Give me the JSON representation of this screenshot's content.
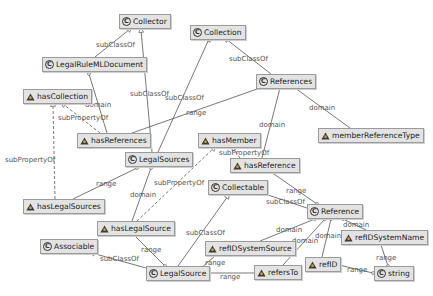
{
  "diagram": {
    "nodes": {
      "collector": {
        "label": "Collector",
        "kind": "class",
        "icon": "class-icon"
      },
      "collection": {
        "label": "Collection",
        "kind": "class",
        "icon": "class-icon"
      },
      "legalruleml_document": {
        "label": "LegalRuleMLDocument",
        "kind": "class",
        "icon": "class-icon"
      },
      "references": {
        "label": "References",
        "kind": "class",
        "icon": "class-icon"
      },
      "has_collection": {
        "label": "hasCollection",
        "kind": "property",
        "icon": "object-property-icon"
      },
      "has_references": {
        "label": "hasReferences",
        "kind": "property",
        "icon": "object-property-icon"
      },
      "member_reference_type": {
        "label": "memberReferenceType",
        "kind": "property",
        "icon": "object-property-icon"
      },
      "has_member": {
        "label": "hasMember",
        "kind": "property",
        "icon": "object-property-icon"
      },
      "legal_sources": {
        "label": "LegalSources",
        "kind": "class",
        "icon": "class-icon"
      },
      "has_reference": {
        "label": "hasReference",
        "kind": "property",
        "icon": "object-property-icon"
      },
      "collectable": {
        "label": "Collectable",
        "kind": "class",
        "icon": "class-icon"
      },
      "has_legal_sources": {
        "label": "hasLegalSources",
        "kind": "property",
        "icon": "object-property-icon"
      },
      "reference": {
        "label": "Reference",
        "kind": "class",
        "icon": "class-icon"
      },
      "has_legal_source": {
        "label": "hasLegalSource",
        "kind": "property",
        "icon": "object-property-icon"
      },
      "ref_id_system_name": {
        "label": "refIDSystemName",
        "kind": "property",
        "icon": "object-property-icon"
      },
      "ref_id_system_source": {
        "label": "refIDSystemSource",
        "kind": "property",
        "icon": "object-property-icon"
      },
      "associable": {
        "label": "Associable",
        "kind": "class",
        "icon": "class-icon"
      },
      "ref_id": {
        "label": "refID",
        "kind": "property",
        "icon": "object-property-icon"
      },
      "legal_source": {
        "label": "LegalSource",
        "kind": "class",
        "icon": "class-icon"
      },
      "refers_to": {
        "label": "refersTo",
        "kind": "property",
        "icon": "object-property-icon"
      },
      "string": {
        "label": "string",
        "kind": "class",
        "icon": "class-icon"
      }
    },
    "class_glyph": "C",
    "edge_labels": {
      "e1": "subClassOf",
      "e2": "subClassOf",
      "e3": "subClassOf",
      "e4": "subClassOf",
      "e5": "domain",
      "e6": "subPropertyOf",
      "e7": "range",
      "e8": "domain",
      "e9": "domain",
      "e10": "subPropertyOf",
      "e11": "range",
      "e12": "subPropertyOf",
      "e13": "domain",
      "e14": "subPropertyOf",
      "e15": "range",
      "e16": "subClassOf",
      "e17": "range",
      "e18": "subClassOf",
      "e19": "domain",
      "e20": "domain",
      "e21": "domain",
      "e22": "domain",
      "e23": "range",
      "e24": "range",
      "e25": "range",
      "e26": "subClassOf",
      "e27": "range",
      "e28": "range"
    },
    "colors": {
      "node_fill": "#e3e3e3",
      "node_border": "#9a9a9a",
      "edge": "#555555",
      "edge_label": "#555555",
      "property_icon_fill": "#3a3a3a"
    }
  }
}
